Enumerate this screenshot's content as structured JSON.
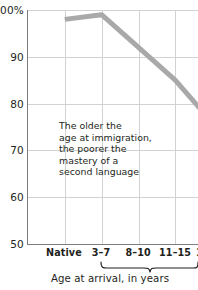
{
  "chart_data": {
    "type": "line",
    "title": "",
    "subtitle": "",
    "xlabel": "Age at arrival, in years",
    "ylabel": "",
    "categories": [
      "Native",
      "3–7",
      "8–10",
      "11–15",
      "17–39"
    ],
    "series": [
      {
        "name": "Mastery of second language",
        "values": [
          98,
          99,
          92,
          85,
          76
        ],
        "color": "#a9a9a9"
      }
    ],
    "ylim": [
      50,
      100
    ],
    "yticks": [
      50,
      60,
      70,
      80,
      90,
      100
    ],
    "ytick_labels": [
      "50",
      "60",
      "70",
      "80",
      "90",
      "100%"
    ],
    "grid": true,
    "legend": "none",
    "annotations": [
      {
        "name": "trend-note",
        "lines": [
          "The older the",
          "age at immigration,",
          "the poorer the",
          "mastery of a",
          "second language"
        ]
      }
    ],
    "axis_brace": {
      "label": "Age at arrival, in years",
      "spans_categories": [
        "3–7",
        "8–10",
        "11–15",
        "17–39"
      ]
    }
  },
  "colors": {
    "line": "#a9a9a9",
    "grid": "#d2d2d2",
    "axis": "#7d7d7d",
    "text": "#231f20",
    "background": "#ffffff"
  }
}
